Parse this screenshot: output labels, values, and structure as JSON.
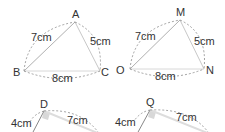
{
  "figures": [
    {
      "name": "triangle-abc",
      "vertices": {
        "A": "A",
        "B": "B",
        "C": "C"
      },
      "sides": {
        "AB": "7cm",
        "AC": "5cm",
        "BC": "8cm"
      }
    },
    {
      "name": "triangle-mon",
      "vertices": {
        "M": "M",
        "O": "O",
        "N": "N"
      },
      "sides": {
        "MO": "7cm",
        "MN": "5cm",
        "ON": "8cm"
      }
    },
    {
      "name": "triangle-d",
      "vertices": {
        "D": "D"
      },
      "sides": {
        "left": "4cm",
        "right": "7cm"
      }
    },
    {
      "name": "triangle-q",
      "vertices": {
        "Q": "Q"
      },
      "sides": {
        "left": "4cm",
        "right": "7cm"
      }
    }
  ],
  "colors": {
    "solid_line": "#b8b8b8",
    "dashed_line": "#8a8a8a",
    "text": "#333333",
    "right_angle_fill": "#d8d8d8"
  }
}
